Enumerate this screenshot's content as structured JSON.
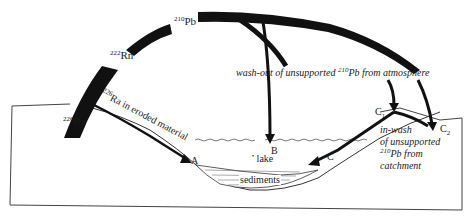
{
  "diagram": {
    "nodes": {
      "pb210": {
        "isotope": "210",
        "element": "Pb"
      },
      "rn222": {
        "isotope": "222",
        "element": "Rn"
      },
      "ra226_source": {
        "isotope": "226",
        "element": "Ra"
      }
    },
    "flows": {
      "eroded": {
        "prefix_isotope": "226",
        "text": "Ra in eroded material"
      },
      "washout": {
        "text_before": "wash-out of unsupported ",
        "isotope": "210",
        "text_after": "Pb from atmosphere"
      },
      "inwash": {
        "line1": "in-wash",
        "line2": "of unsupported",
        "line3_isotope": "210",
        "line3_text": "Pb from",
        "line4": "catchment"
      }
    },
    "points": {
      "A": "A",
      "B": "B",
      "C": "C",
      "C1_base": "C",
      "C1_sub": "1",
      "C2_base": "C",
      "C2_sub": "2"
    },
    "regions": {
      "lake": "lake",
      "sediments": "sediments"
    },
    "colors": {
      "ink": "#111111",
      "line": "#333333",
      "background": "#ffffff"
    }
  }
}
